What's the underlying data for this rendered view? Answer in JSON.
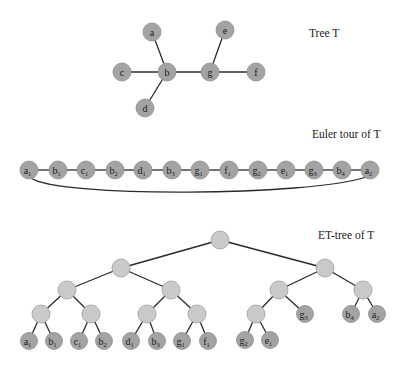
{
  "labels": {
    "tree": "Tree T",
    "euler": "Euler tour of T",
    "ettree": "ET-tree of T"
  },
  "colors": {
    "leaf_fill": "#a3a3a3",
    "inner_fill": "#cacaca",
    "edge": "#2a2a2a"
  },
  "tree": {
    "nodes": [
      {
        "id": "a",
        "label": "a",
        "x": 152,
        "y": 32
      },
      {
        "id": "c",
        "label": "c",
        "x": 122,
        "y": 72
      },
      {
        "id": "b",
        "label": "b",
        "x": 167,
        "y": 72
      },
      {
        "id": "d",
        "label": "d",
        "x": 145,
        "y": 108
      },
      {
        "id": "g",
        "label": "g",
        "x": 210,
        "y": 72
      },
      {
        "id": "e",
        "label": "e",
        "x": 225,
        "y": 30
      },
      {
        "id": "f",
        "label": "f",
        "x": 256,
        "y": 72
      }
    ],
    "edges": [
      [
        "a",
        "b"
      ],
      [
        "c",
        "b"
      ],
      [
        "d",
        "b"
      ],
      [
        "b",
        "g"
      ],
      [
        "e",
        "g"
      ],
      [
        "g",
        "f"
      ]
    ]
  },
  "euler_tour": {
    "y": 170,
    "nodes": [
      {
        "label": "a",
        "sub": "1",
        "x": 29
      },
      {
        "label": "b",
        "sub": "1",
        "x": 58
      },
      {
        "label": "c",
        "sub": "1",
        "x": 86
      },
      {
        "label": "b",
        "sub": "2",
        "x": 115
      },
      {
        "label": "d",
        "sub": "1",
        "x": 143
      },
      {
        "label": "b",
        "sub": "3",
        "x": 172
      },
      {
        "label": "g",
        "sub": "1",
        "x": 200
      },
      {
        "label": "f",
        "sub": "1",
        "x": 229
      },
      {
        "label": "g",
        "sub": "2",
        "x": 258
      },
      {
        "label": "e",
        "sub": "1",
        "x": 286
      },
      {
        "label": "g",
        "sub": "3",
        "x": 314
      },
      {
        "label": "b",
        "sub": "4",
        "x": 342
      },
      {
        "label": "a",
        "sub": "2",
        "x": 370
      }
    ]
  },
  "et_tree": {
    "inner": [
      {
        "id": "r",
        "x": 220,
        "y": 240
      },
      {
        "id": "L",
        "x": 121,
        "y": 268
      },
      {
        "id": "R",
        "x": 325,
        "y": 268
      },
      {
        "id": "LL",
        "x": 67,
        "y": 290
      },
      {
        "id": "LR",
        "x": 171,
        "y": 290
      },
      {
        "id": "RL",
        "x": 279,
        "y": 290
      },
      {
        "id": "RR",
        "x": 363,
        "y": 290
      },
      {
        "id": "LLL",
        "x": 41,
        "y": 314
      },
      {
        "id": "LLR",
        "x": 91,
        "y": 314
      },
      {
        "id": "LRL",
        "x": 147,
        "y": 314
      },
      {
        "id": "LRR",
        "x": 197,
        "y": 314
      },
      {
        "id": "RLL",
        "x": 256,
        "y": 314
      }
    ],
    "leaves": [
      {
        "id": "a1",
        "label": "a",
        "sub": "1",
        "x": 29,
        "y": 341
      },
      {
        "id": "b1",
        "label": "b",
        "sub": "1",
        "x": 54,
        "y": 341
      },
      {
        "id": "c1",
        "label": "c",
        "sub": "1",
        "x": 79,
        "y": 341
      },
      {
        "id": "b2",
        "label": "b",
        "sub": "2",
        "x": 104,
        "y": 341
      },
      {
        "id": "d1",
        "label": "d",
        "sub": "1",
        "x": 131,
        "y": 341
      },
      {
        "id": "b3",
        "label": "b",
        "sub": "3",
        "x": 157,
        "y": 341
      },
      {
        "id": "g1",
        "label": "g",
        "sub": "1",
        "x": 182,
        "y": 341
      },
      {
        "id": "f1",
        "label": "f",
        "sub": "1",
        "x": 208,
        "y": 341
      },
      {
        "id": "g2",
        "label": "g",
        "sub": "2",
        "x": 245,
        "y": 340
      },
      {
        "id": "e1",
        "label": "e",
        "sub": "1",
        "x": 270,
        "y": 340
      },
      {
        "id": "g3",
        "label": "g",
        "sub": "3",
        "x": 305,
        "y": 314
      },
      {
        "id": "b4",
        "label": "b",
        "sub": "4",
        "x": 351,
        "y": 314
      },
      {
        "id": "a2",
        "label": "a",
        "sub": "2",
        "x": 377,
        "y": 314
      }
    ],
    "edges": [
      [
        "r",
        "L"
      ],
      [
        "r",
        "R"
      ],
      [
        "L",
        "LL"
      ],
      [
        "L",
        "LR"
      ],
      [
        "R",
        "RL"
      ],
      [
        "R",
        "RR"
      ],
      [
        "LL",
        "LLL"
      ],
      [
        "LL",
        "LLR"
      ],
      [
        "LR",
        "LRL"
      ],
      [
        "LR",
        "LRR"
      ],
      [
        "RL",
        "RLL"
      ],
      [
        "RL",
        "g3"
      ],
      [
        "RR",
        "b4"
      ],
      [
        "RR",
        "a2"
      ],
      [
        "LLL",
        "a1"
      ],
      [
        "LLL",
        "b1"
      ],
      [
        "LLR",
        "c1"
      ],
      [
        "LLR",
        "b2"
      ],
      [
        "LRL",
        "d1"
      ],
      [
        "LRL",
        "b3"
      ],
      [
        "LRR",
        "g1"
      ],
      [
        "LRR",
        "f1"
      ],
      [
        "RLL",
        "g2"
      ],
      [
        "RLL",
        "e1"
      ]
    ]
  }
}
